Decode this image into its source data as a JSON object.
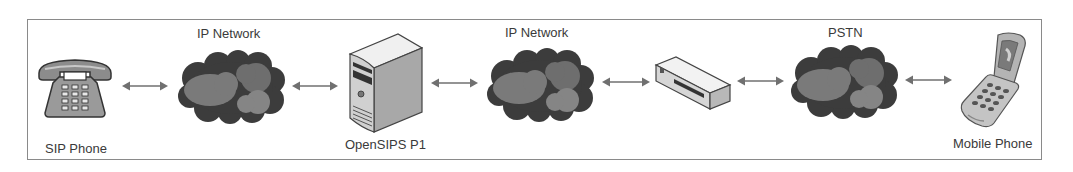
{
  "diagram": {
    "title": "",
    "colors": {
      "border": "#8a8a8a",
      "arrow": "#707070",
      "cloud_dark": "#3c3c3c",
      "cloud_mid": "#7a7a7a",
      "cloud_light": "#8c8c8c",
      "text": "#3a3a3a"
    },
    "nodes": [
      {
        "id": "sip-phone",
        "type": "desk-phone-icon",
        "label": "SIP Phone",
        "label_position": "below"
      },
      {
        "id": "ip-network-1",
        "type": "cloud-icon",
        "label": "IP Network",
        "label_position": "above"
      },
      {
        "id": "opensips-p1",
        "type": "server-icon",
        "label": "OpenSIPS P1",
        "label_position": "below"
      },
      {
        "id": "ip-network-2",
        "type": "cloud-icon",
        "label": "IP Network",
        "label_position": "above"
      },
      {
        "id": "gateway",
        "type": "gateway-box-icon",
        "label": "",
        "label_position": "none"
      },
      {
        "id": "pstn",
        "type": "cloud-icon",
        "label": "PSTN",
        "label_position": "above"
      },
      {
        "id": "mobile-phone",
        "type": "mobile-phone-icon",
        "label": "Mobile Phone",
        "label_position": "below"
      }
    ],
    "edges": [
      {
        "from": "sip-phone",
        "to": "ip-network-1",
        "style": "bidirectional-arrow"
      },
      {
        "from": "ip-network-1",
        "to": "opensips-p1",
        "style": "bidirectional-arrow"
      },
      {
        "from": "opensips-p1",
        "to": "ip-network-2",
        "style": "bidirectional-arrow"
      },
      {
        "from": "ip-network-2",
        "to": "gateway",
        "style": "bidirectional-arrow"
      },
      {
        "from": "gateway",
        "to": "pstn",
        "style": "bidirectional-arrow"
      },
      {
        "from": "pstn",
        "to": "mobile-phone",
        "style": "bidirectional-arrow"
      }
    ]
  }
}
